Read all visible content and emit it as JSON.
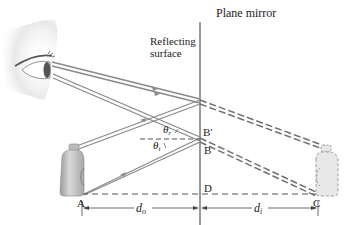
{
  "diagram": {
    "title": "Plane mirror",
    "surface_label_line1": "Reflecting",
    "surface_label_line2": "surface",
    "points": {
      "A": "A",
      "B": "B",
      "B_prime": "B′",
      "C": "C",
      "D": "D"
    },
    "angles": {
      "reflected": "θ",
      "reflected_sub": "r",
      "incident": "θ",
      "incident_sub": "i"
    },
    "distances": {
      "object": "d",
      "object_sub": "o",
      "image": "d",
      "image_sub": "i"
    },
    "colors": {
      "ray": "#8a8a8a",
      "mirror": "#9a9a9a",
      "dashed": "#6f6f6f",
      "text": "#222222",
      "bottle": "#b8b8b8"
    }
  }
}
